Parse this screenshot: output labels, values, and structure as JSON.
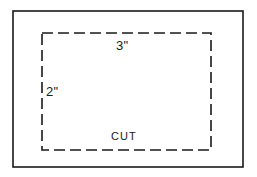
{
  "diagram": {
    "background_color": "#ffffff",
    "line_color": "#1a1a1a",
    "outer_border": {
      "name": "outer-solid-rectangle",
      "x": 13,
      "y": 11,
      "width": 230,
      "height": 156,
      "stroke_width": 1.6,
      "style": "solid"
    },
    "cut_rectangle": {
      "name": "inner-dashed-rectangle",
      "x": 42,
      "y": 33,
      "width": 169,
      "height": 117,
      "stroke_width": 1.6,
      "style": "dashed",
      "dash_length": 11,
      "dash_gap": 5
    },
    "labels": {
      "width_label": "3\"",
      "height_label": "2\"",
      "action_label": "CUT"
    }
  }
}
